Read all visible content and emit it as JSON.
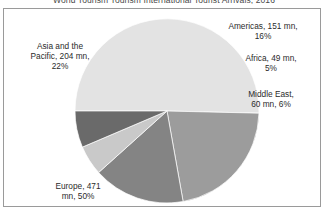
{
  "chart_title": "World Tourism Tourism International Tourist Arrivals, 2016",
  "labels": {
    "asia": "Asia and the\nPacific, 204 mn,\n22%",
    "americas": "Americas, 151 mn,\n16%",
    "africa": "Africa, 49 mn,\n5%",
    "middle_east": "Middle East,\n60 mn, 6%",
    "europe": "Europe, 471\nmn, 50%"
  },
  "chart_data": {
    "type": "pie",
    "title": "World Tourism Tourism International Tourist Arrivals, 2016",
    "unit": "mn",
    "total": 935,
    "start_angle_deg": 180,
    "direction": "clockwise",
    "legend": "none",
    "grid": false,
    "categories": [
      "Europe",
      "Asia and the Pacific",
      "Americas",
      "Africa",
      "Middle East"
    ],
    "values": [
      471,
      204,
      151,
      49,
      60
    ],
    "percents": [
      50,
      22,
      16,
      5,
      6
    ],
    "colors": [
      "#e3e3e3",
      "#9c9c9c",
      "#848484",
      "#c9c9c9",
      "#6a6a6a"
    ],
    "slices": [
      {
        "name": "Europe",
        "value": 471,
        "percent": 50,
        "color": "#e3e3e3",
        "label": "Europe, 471 mn, 50%"
      },
      {
        "name": "Asia and the Pacific",
        "value": 204,
        "percent": 22,
        "color": "#9c9c9c",
        "label": "Asia and the Pacific, 204 mn, 22%"
      },
      {
        "name": "Americas",
        "value": 151,
        "percent": 16,
        "color": "#848484",
        "label": "Americas, 151 mn, 16%"
      },
      {
        "name": "Africa",
        "value": 49,
        "percent": 5,
        "color": "#c9c9c9",
        "label": "Africa, 49 mn, 5%"
      },
      {
        "name": "Middle East",
        "value": 60,
        "percent": 6,
        "color": "#6a6a6a",
        "label": "Middle East, 60 mn, 6%"
      }
    ],
    "geometry": {
      "cx": 163,
      "cy": 102,
      "r": 92
    }
  }
}
